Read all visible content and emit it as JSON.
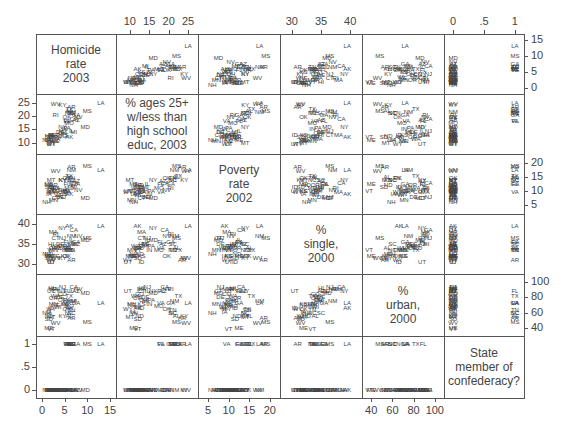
{
  "chart_data": {
    "type": "scatter",
    "subtype": "scatterplot-matrix",
    "title": "",
    "variables": [
      {
        "name": "Homicide rate 2003",
        "label_lines": [
          "Homicide",
          "rate",
          "2003"
        ],
        "range": [
          0,
          15
        ],
        "ticks": [
          0,
          5,
          10,
          15
        ],
        "tick_side": "top-right",
        "axis_min": 0,
        "axis_max": 15
      },
      {
        "name": "% ages 25+ w/less than high school educ, 2003",
        "label_lines": [
          "% ages 25+",
          "w/less than",
          "high school",
          "educ, 2003"
        ],
        "range": [
          8,
          26
        ],
        "ticks": [
          10,
          15,
          20,
          25
        ],
        "axis_min": 8,
        "axis_max": 26
      },
      {
        "name": "Poverty rate 2002",
        "label_lines": [
          "Poverty",
          "rate",
          "2002"
        ],
        "range": [
          4,
          21
        ],
        "ticks": [
          5,
          10,
          15,
          20
        ],
        "axis_min": 4,
        "axis_max": 21
      },
      {
        "name": "% single, 2000",
        "label_lines": [
          "%",
          "single,",
          "2000"
        ],
        "range": [
          29,
          41
        ],
        "ticks": [
          30,
          35,
          40
        ],
        "axis_min": 29,
        "axis_max": 41
      },
      {
        "name": "% urban, 2000",
        "label_lines": [
          "%",
          "urban,",
          "2000"
        ],
        "range": [
          37,
          103
        ],
        "ticks": [
          40,
          60,
          80,
          100
        ],
        "axis_min": 37,
        "axis_max": 103
      },
      {
        "name": "State member of confederacy?",
        "label_lines": [
          "State",
          "member of",
          "confederacy?"
        ],
        "range": [
          -0.05,
          1.05
        ],
        "ticks": [
          0,
          0.5,
          1
        ],
        "tick_labels": [
          "0",
          ".5",
          "1"
        ],
        "axis_min": -0.05,
        "axis_max": 1.05
      }
    ],
    "axes": {
      "top": [
        {
          "col": 1,
          "ticks": [
            "10",
            "15",
            "20",
            "25"
          ]
        },
        {
          "col": 3,
          "ticks": [
            "30",
            "35",
            "40"
          ]
        },
        {
          "col": 5,
          "ticks": [
            "0",
            ".5",
            "1"
          ]
        }
      ],
      "bottom": [
        {
          "col": 0,
          "ticks": [
            "0",
            "5",
            "10",
            "15"
          ]
        },
        {
          "col": 2,
          "ticks": [
            "5",
            "10",
            "15",
            "20"
          ]
        },
        {
          "col": 4,
          "ticks": [
            "40",
            "60",
            "80",
            "100"
          ]
        }
      ],
      "left": [
        {
          "row": 1,
          "ticks": [
            "10",
            "15",
            "20",
            "25"
          ]
        },
        {
          "row": 3,
          "ticks": [
            "30",
            "35",
            "40"
          ]
        },
        {
          "row": 5,
          "ticks": [
            "0",
            ".5",
            "1"
          ]
        }
      ],
      "right": [
        {
          "row": 0,
          "ticks": [
            "0",
            "5",
            "10",
            "15"
          ]
        },
        {
          "row": 2,
          "ticks": [
            "5",
            "10",
            "15",
            "20"
          ]
        },
        {
          "row": 4,
          "ticks": [
            "40",
            "60",
            "80",
            "100"
          ]
        }
      ]
    },
    "states": [
      {
        "s": "LA",
        "v": [
          13.0,
          25.0,
          17.5,
          39.5,
          72,
          1
        ]
      },
      {
        "s": "MS",
        "v": [
          10.0,
          22.0,
          19.0,
          36.5,
          48,
          1
        ]
      },
      {
        "s": "MD",
        "v": [
          9.5,
          16.0,
          7.5,
          36.0,
          86,
          0
        ]
      },
      {
        "s": "NV",
        "v": [
          8.0,
          19.5,
          10.5,
          37.0,
          91,
          0
        ]
      },
      {
        "s": "AZ",
        "v": [
          7.5,
          18.5,
          13.5,
          35.0,
          88,
          0
        ]
      },
      {
        "s": "IL",
        "v": [
          6.5,
          14.5,
          12.5,
          36.0,
          88,
          0
        ]
      },
      {
        "s": "TX",
        "v": [
          6.0,
          22.5,
          15.5,
          33.5,
          82,
          1
        ]
      },
      {
        "s": "CA",
        "v": [
          7.0,
          19.0,
          13.0,
          38.5,
          94,
          0
        ]
      },
      {
        "s": "GA",
        "v": [
          7.5,
          20.5,
          12.5,
          35.5,
          72,
          1
        ]
      },
      {
        "s": "AL",
        "v": [
          6.0,
          22.0,
          15.0,
          34.0,
          55,
          1
        ]
      },
      {
        "s": "NM",
        "v": [
          6.5,
          21.5,
          17.5,
          37.0,
          75,
          0
        ]
      },
      {
        "s": "AR",
        "v": [
          6.5,
          23.5,
          18.5,
          31.0,
          53,
          1
        ]
      },
      {
        "s": "TN",
        "v": [
          6.5,
          21.0,
          14.5,
          33.5,
          64,
          1
        ]
      },
      {
        "s": "SC",
        "v": [
          6.5,
          21.0,
          14.0,
          35.0,
          60,
          1
        ]
      },
      {
        "s": "FL",
        "v": [
          5.5,
          18.0,
          12.5,
          35.5,
          89,
          1
        ]
      },
      {
        "s": "NC",
        "v": [
          6.0,
          21.0,
          14.0,
          33.5,
          60,
          1
        ]
      },
      {
        "s": "VA",
        "v": [
          5.5,
          18.0,
          9.5,
          34.0,
          73,
          1
        ]
      },
      {
        "s": "MO",
        "v": [
          6.0,
          17.5,
          11.0,
          33.5,
          69,
          0
        ]
      },
      {
        "s": "MI",
        "v": [
          7.0,
          14.0,
          11.5,
          35.0,
          75,
          0
        ]
      },
      {
        "s": "KY",
        "v": [
          4.5,
          24.0,
          14.0,
          31.5,
          56,
          0
        ]
      },
      {
        "s": "WV",
        "v": [
          3.0,
          24.5,
          17.0,
          31.5,
          46,
          0
        ]
      },
      {
        "s": "OK",
        "v": [
          5.5,
          19.5,
          14.5,
          32.0,
          65,
          0
        ]
      },
      {
        "s": "NY",
        "v": [
          4.5,
          16.0,
          14.0,
          39.0,
          88,
          0
        ]
      },
      {
        "s": "NJ",
        "v": [
          4.5,
          14.5,
          8.0,
          36.5,
          94,
          0
        ]
      },
      {
        "s": "PA",
        "v": [
          5.5,
          15.5,
          10.0,
          34.5,
          77,
          0
        ]
      },
      {
        "s": "AK",
        "v": [
          6.0,
          12.0,
          9.0,
          39.5,
          66,
          0
        ]
      },
      {
        "s": "CO",
        "v": [
          4.5,
          12.5,
          9.5,
          34.0,
          84,
          0
        ]
      },
      {
        "s": "DE",
        "v": [
          4.0,
          14.0,
          8.0,
          35.0,
          80,
          0
        ]
      },
      {
        "s": "RI",
        "v": [
          3.0,
          20.5,
          11.0,
          37.5,
          91,
          0
        ]
      },
      {
        "s": "OH",
        "v": [
          4.5,
          13.5,
          10.5,
          34.5,
          77,
          0
        ]
      },
      {
        "s": "IN",
        "v": [
          5.0,
          15.0,
          9.0,
          33.5,
          71,
          0
        ]
      },
      {
        "s": "KS",
        "v": [
          5.0,
          13.0,
          10.0,
          32.0,
          71,
          0
        ]
      },
      {
        "s": "WA",
        "v": [
          3.0,
          11.5,
          11.0,
          34.5,
          82,
          0
        ]
      },
      {
        "s": "OR",
        "v": [
          2.5,
          12.0,
          12.0,
          34.0,
          79,
          0
        ]
      },
      {
        "s": "CT",
        "v": [
          3.0,
          13.0,
          7.5,
          36.5,
          88,
          0
        ]
      },
      {
        "s": "MA",
        "v": [
          2.5,
          13.0,
          9.5,
          38.0,
          91,
          0
        ]
      },
      {
        "s": "WI",
        "v": [
          3.5,
          12.0,
          8.5,
          34.0,
          68,
          0
        ]
      },
      {
        "s": "MN",
        "v": [
          2.5,
          10.5,
          7.0,
          33.5,
          71,
          0
        ]
      },
      {
        "s": "IA",
        "v": [
          1.5,
          11.0,
          9.0,
          32.0,
          61,
          0
        ]
      },
      {
        "s": "NE",
        "v": [
          3.0,
          10.5,
          10.0,
          32.0,
          70,
          0
        ]
      },
      {
        "s": "SD",
        "v": [
          1.5,
          12.0,
          11.5,
          31.5,
          52,
          0
        ]
      },
      {
        "s": "ND",
        "v": [
          1.5,
          12.5,
          12.0,
          32.5,
          56,
          0
        ]
      },
      {
        "s": "MT",
        "v": [
          2.0,
          10.0,
          14.0,
          32.0,
          54,
          0
        ]
      },
      {
        "s": "WY",
        "v": [
          2.0,
          9.5,
          9.5,
          31.0,
          65,
          0
        ]
      },
      {
        "s": "ID",
        "v": [
          2.0,
          13.0,
          11.5,
          30.5,
          66,
          0
        ]
      },
      {
        "s": "UT",
        "v": [
          2.0,
          9.5,
          10.0,
          30.5,
          88,
          0
        ]
      },
      {
        "s": "HI",
        "v": [
          2.0,
          13.0,
          11.0,
          35.0,
          92,
          0
        ]
      },
      {
        "s": "ME",
        "v": [
          1.5,
          11.0,
          12.5,
          32.0,
          40,
          0
        ]
      },
      {
        "s": "NH",
        "v": [
          1.0,
          11.0,
          6.0,
          32.5,
          59,
          0
        ]
      },
      {
        "s": "VT",
        "v": [
          2.0,
          12.0,
          10.0,
          33.5,
          38,
          0
        ]
      }
    ],
    "legend": null,
    "grid": false
  }
}
